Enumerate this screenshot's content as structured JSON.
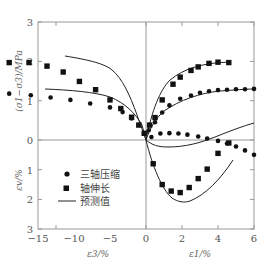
{
  "chart_data": {
    "type": "scatter",
    "title": "",
    "xlabel_left": "ε3/%",
    "xlabel_right": "ε1/%",
    "ylabel_upper": "(σ1−σ3)/MPa",
    "ylabel_lower": "εv/%",
    "xlim": [
      -15,
      6
    ],
    "ylim_upper": [
      0,
      3
    ],
    "ylim_lower": [
      0,
      3
    ],
    "x_ticks": [
      -15,
      -10,
      -5,
      0,
      2,
      4,
      6
    ],
    "x_tick_labels": [
      "−15",
      "−10",
      "−5",
      "0",
      "2",
      "4",
      "6"
    ],
    "y_ticks_upper": [
      0,
      1,
      2,
      3
    ],
    "y_ticks_lower": [
      1,
      2,
      3
    ],
    "grid": false,
    "legend_position": "lower-left inside plot",
    "legend": [
      {
        "marker": "circle",
        "label": "三轴压缩"
      },
      {
        "marker": "square",
        "label": "轴伸长"
      },
      {
        "marker": "line",
        "label": "预测值"
      }
    ],
    "series": [
      {
        "name": "三轴压缩 (σ1−σ3) vs ε3",
        "marker": "circle",
        "panel": "upper",
        "x": [
          -14.5,
          -13.4,
          -12.2,
          -11.0,
          -9.9,
          -8.7,
          -7.6,
          -6.4,
          -5.3,
          -4.2,
          -3.1,
          -2.0,
          -1.3,
          -0.8,
          -0.4,
          -0.1
        ],
        "y": [
          1.29,
          1.28,
          1.27,
          1.25,
          1.24,
          1.21,
          1.18,
          1.14,
          1.08,
          1.02,
          0.93,
          0.83,
          0.71,
          0.55,
          0.38,
          0.17
        ]
      },
      {
        "name": "轴伸长 (σ1−σ3) vs ε3",
        "marker": "square",
        "panel": "upper",
        "x": [
          -9.6,
          -8.6,
          -7.6,
          -6.5,
          -5.5,
          -4.6,
          -3.7,
          -2.8,
          -2.0,
          -1.4,
          -0.8,
          -0.4,
          -0.1
        ],
        "y": [
          1.93,
          1.97,
          1.97,
          1.97,
          1.88,
          1.73,
          1.49,
          1.28,
          1.02,
          0.8,
          0.58,
          0.38,
          0.17
        ]
      },
      {
        "name": "三轴压缩 (σ1−σ3) vs ε1",
        "marker": "circle",
        "panel": "upper",
        "x": [
          0.15,
          0.5,
          0.9,
          1.3,
          1.9,
          2.5,
          3.0,
          3.5,
          4.0,
          4.5,
          5.0,
          5.5,
          6.0
        ],
        "y": [
          0.25,
          0.45,
          0.7,
          0.88,
          1.05,
          1.13,
          1.2,
          1.24,
          1.27,
          1.28,
          1.29,
          1.29,
          1.3
        ]
      },
      {
        "name": "轴伸长 (σ1−σ3) vs ε1",
        "marker": "square",
        "panel": "upper",
        "x": [
          0.2,
          0.5,
          0.9,
          1.5,
          1.9,
          2.5,
          2.9,
          3.5,
          4.0,
          4.6
        ],
        "y": [
          0.38,
          0.57,
          1.02,
          1.42,
          1.6,
          1.77,
          1.86,
          1.95,
          1.98,
          1.97
        ]
      },
      {
        "name": "三轴压缩 εv vs ε1",
        "marker": "circle",
        "panel": "lower",
        "x": [
          0.3,
          0.8,
          1.3,
          1.8,
          2.3,
          2.9,
          3.4,
          4.0,
          4.5,
          5.0,
          5.5,
          6.0
        ],
        "y": [
          -0.1,
          -0.22,
          -0.23,
          -0.22,
          -0.18,
          -0.12,
          -0.05,
          0.03,
          0.12,
          0.22,
          0.35,
          0.5
        ]
      },
      {
        "name": "轴伸长 εv vs ε1",
        "marker": "square",
        "panel": "lower",
        "x": [
          0.4,
          0.9,
          1.4,
          1.9,
          2.4,
          2.9,
          3.4,
          4.0,
          4.6
        ],
        "y": [
          0.8,
          1.5,
          1.72,
          1.77,
          1.6,
          1.3,
          0.98,
          0.45,
          0.1
        ]
      },
      {
        "name": "预测值 (lines)",
        "marker": "line",
        "panel": "both",
        "note": "smooth prediction curves through each data set"
      }
    ]
  },
  "labels": {
    "y_upper_title": "(σ1−σ3)/MPa",
    "y_lower_title": "εv/%",
    "x_left_title": "ε3/%",
    "x_right_title": "ε1/%",
    "legend_1": "三轴压缩",
    "legend_2": "轴伸长",
    "legend_3": "预测值",
    "x_tick_0": "−15",
    "x_tick_1": "−10",
    "x_tick_2": "−5",
    "x_tick_3": "0",
    "x_tick_4": "2",
    "x_tick_5": "4",
    "x_tick_6": "6",
    "yu_tick_0": "0",
    "yu_tick_1": "1",
    "yu_tick_2": "2",
    "yu_tick_3": "3",
    "yl_tick_1": "1",
    "yl_tick_2": "2",
    "yl_tick_3": "3"
  },
  "colors": {
    "axis": "#888888",
    "marker": "#111111",
    "line": "#222222",
    "text": "#555555"
  }
}
